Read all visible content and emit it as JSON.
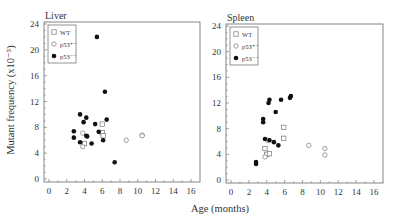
{
  "chart_data": [
    {
      "type": "scatter",
      "title": "Liver",
      "xlabel": "Age (months)",
      "ylabel": "Mutant frequency (x10⁻⁵)",
      "xlim": [
        -1,
        17
      ],
      "ylim": [
        0,
        24
      ],
      "xticks": [
        0,
        2,
        4,
        6,
        8,
        10,
        12,
        14,
        16
      ],
      "yticks": [
        0,
        4,
        8,
        12,
        16,
        20,
        24
      ],
      "legend": [
        "WT",
        "p53+/-",
        "p53-/-"
      ],
      "legend_position": "upper-left",
      "series": [
        {
          "name": "WT",
          "marker": "open-square",
          "points": [
            [
              4.0,
              5.5
            ],
            [
              6.0,
              8.5
            ],
            [
              6.0,
              7.2
            ],
            [
              6.1,
              6.7
            ]
          ]
        },
        {
          "name": "p53+/-",
          "marker": "open-circle",
          "points": [
            [
              3.8,
              7.1
            ],
            [
              3.8,
              5.0
            ],
            [
              8.7,
              6.0
            ],
            [
              10.5,
              6.8
            ],
            [
              10.5,
              6.7
            ]
          ]
        },
        {
          "name": "p53-/-",
          "marker": "filled-circle",
          "points": [
            [
              2.8,
              7.4
            ],
            [
              2.8,
              6.4
            ],
            [
              3.5,
              10.0
            ],
            [
              3.5,
              5.7
            ],
            [
              3.9,
              8.8
            ],
            [
              4.2,
              9.5
            ],
            [
              4.2,
              6.7
            ],
            [
              4.3,
              6.6
            ],
            [
              4.8,
              5.5
            ],
            [
              5.2,
              8.5
            ],
            [
              5.6,
              7.3
            ],
            [
              6.1,
              6.0
            ],
            [
              6.5,
              9.2
            ],
            [
              7.4,
              2.6
            ],
            [
              5.4,
              22.0
            ],
            [
              6.3,
              13.5
            ]
          ]
        }
      ]
    },
    {
      "type": "scatter",
      "title": "Spleen",
      "xlabel": "Age (months)",
      "ylabel": "",
      "xlim": [
        -1,
        17
      ],
      "ylim": [
        0,
        24
      ],
      "xticks": [
        0,
        2,
        4,
        6,
        8,
        10,
        12,
        14,
        16
      ],
      "yticks": [
        0,
        4,
        8,
        12,
        16,
        20,
        24
      ],
      "legend": [
        "WT",
        "p53+/-",
        "p53-/-"
      ],
      "legend_position": "upper-left",
      "series": [
        {
          "name": "WT",
          "marker": "open-square",
          "points": [
            [
              3.8,
              4.9
            ],
            [
              4.0,
              4.0
            ],
            [
              4.3,
              4.1
            ],
            [
              5.9,
              8.2
            ],
            [
              5.9,
              6.5
            ]
          ]
        },
        {
          "name": "p53+/-",
          "marker": "open-circle",
          "points": [
            [
              3.8,
              3.6
            ],
            [
              4.1,
              6.2
            ],
            [
              8.7,
              5.4
            ],
            [
              10.5,
              4.9
            ],
            [
              10.5,
              3.9
            ]
          ]
        },
        {
          "name": "p53-/-",
          "marker": "filled-circle",
          "points": [
            [
              2.8,
              2.8
            ],
            [
              2.8,
              2.5
            ],
            [
              3.6,
              9.5
            ],
            [
              3.6,
              9.0
            ],
            [
              3.8,
              6.4
            ],
            [
              4.2,
              12.0
            ],
            [
              4.3,
              12.5
            ],
            [
              4.3,
              6.2
            ],
            [
              4.8,
              5.9
            ],
            [
              5.0,
              10.6
            ],
            [
              5.3,
              5.4
            ],
            [
              5.6,
              12.5
            ],
            [
              6.6,
              12.8
            ],
            [
              6.7,
              13.1
            ]
          ]
        }
      ]
    }
  ],
  "panels": {
    "left_title": "Liver",
    "right_title": "Spleen",
    "xlabel": "Age (months)",
    "ylabel": "Mutant frequency (x10⁻⁵)",
    "legend": {
      "wt": "WT",
      "het": "p53⁺⁻",
      "null": "p53⁻⁻"
    }
  }
}
